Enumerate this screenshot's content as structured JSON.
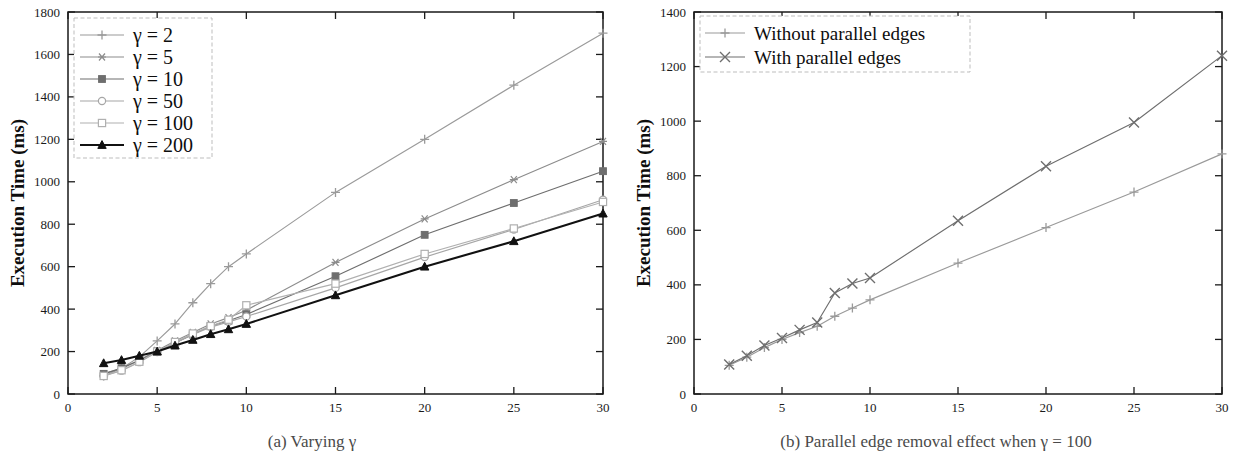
{
  "figure": {
    "panels": [
      {
        "id": "a",
        "caption": "(a)  Varying γ",
        "xlabel": "Average degree",
        "ylabel": "Execution Time (ms)"
      },
      {
        "id": "b",
        "caption": "(b)  Parallel edge removal effect when γ = 100",
        "xlabel": "Average degree",
        "ylabel": "Execution Time (ms)"
      }
    ]
  },
  "chart_data": [
    {
      "type": "line",
      "panel": "a",
      "title": "(a)  Varying γ",
      "xlabel": "Average degree",
      "ylabel": "Execution Time (ms)",
      "xlim": [
        0,
        30
      ],
      "ylim": [
        0,
        1800
      ],
      "xticks": [
        0,
        5,
        10,
        15,
        20,
        25,
        30
      ],
      "yticks": [
        0,
        200,
        400,
        600,
        800,
        1000,
        1200,
        1400,
        1600,
        1800
      ],
      "grid": false,
      "legend_position": "top-left",
      "x": [
        2,
        3,
        4,
        5,
        6,
        7,
        8,
        9,
        10,
        15,
        20,
        25,
        30
      ],
      "series": [
        {
          "name": "γ = 2",
          "marker": "plus",
          "color": "#9a9a9a",
          "values": [
            85,
            120,
            175,
            250,
            330,
            430,
            520,
            600,
            660,
            950,
            1200,
            1455,
            1700
          ]
        },
        {
          "name": "γ = 5",
          "marker": "asterisk",
          "color": "#8c8c8c",
          "values": [
            95,
            120,
            160,
            205,
            250,
            290,
            330,
            360,
            395,
            620,
            825,
            1010,
            1190
          ]
        },
        {
          "name": "γ = 10",
          "marker": "filled-square",
          "color": "#6e6e6e",
          "values": [
            95,
            122,
            158,
            200,
            240,
            280,
            320,
            345,
            375,
            555,
            750,
            900,
            1050
          ]
        },
        {
          "name": "γ = 50",
          "marker": "open-circle",
          "color": "#a6a6a6",
          "values": [
            85,
            110,
            150,
            198,
            240,
            280,
            315,
            340,
            365,
            500,
            645,
            775,
            915
          ]
        },
        {
          "name": "γ = 100",
          "marker": "open-square",
          "color": "#b0b0b0",
          "values": [
            85,
            112,
            152,
            200,
            245,
            285,
            320,
            350,
            418,
            520,
            660,
            780,
            905
          ]
        },
        {
          "name": "γ = 200",
          "marker": "filled-triangle",
          "color": "#111111",
          "values": [
            145,
            160,
            180,
            200,
            228,
            255,
            282,
            305,
            330,
            465,
            600,
            720,
            850
          ]
        }
      ]
    },
    {
      "type": "line",
      "panel": "b",
      "title": "(b)  Parallel edge removal effect when γ = 100",
      "xlabel": "Average degree",
      "ylabel": "Execution Time (ms)",
      "xlim": [
        0,
        30
      ],
      "ylim": [
        0,
        1400
      ],
      "xticks": [
        0,
        5,
        10,
        15,
        20,
        25,
        30
      ],
      "yticks": [
        0,
        200,
        400,
        600,
        800,
        1000,
        1200,
        1400
      ],
      "grid": false,
      "legend_position": "top-left",
      "x": [
        2,
        3,
        4,
        5,
        6,
        7,
        8,
        9,
        10,
        15,
        20,
        25,
        30
      ],
      "series": [
        {
          "name": "Without parallel edges",
          "marker": "plus",
          "color": "#9a9a9a",
          "values": [
            105,
            135,
            170,
            200,
            225,
            248,
            285,
            315,
            345,
            480,
            610,
            740,
            880
          ]
        },
        {
          "name": "With parallel edges",
          "marker": "cross",
          "color": "#6e6e6e",
          "values": [
            108,
            140,
            178,
            205,
            235,
            262,
            370,
            405,
            425,
            635,
            835,
            995,
            1240
          ]
        }
      ]
    }
  ]
}
